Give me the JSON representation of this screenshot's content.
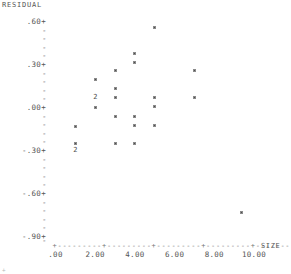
{
  "chart_data": {
    "type": "scatter",
    "title": "",
    "ylabel": "RESIDUAL",
    "xlabel": "SIZE",
    "xlim": [
      0,
      10.5
    ],
    "ylim": [
      -0.9,
      0.6
    ],
    "grid": false,
    "legend": "none",
    "y_tick_labels": [
      ".60+",
      ".30+",
      ".00+",
      "-.30+",
      "-.60+",
      "-.90+"
    ],
    "y_tick_values": [
      0.6,
      0.3,
      0.0,
      -0.3,
      -0.6,
      -0.9
    ],
    "y_minor_tick_count_between": 4,
    "x_tick_labels": [
      ".00",
      "2.00",
      "4.00",
      "6.00",
      "8.00",
      "10.00"
    ],
    "x_tick_values": [
      0,
      2,
      4,
      6,
      8,
      10
    ],
    "point_marker": "small-filled-square",
    "overlap_marker_label": "2",
    "points": [
      {
        "x": 5.0,
        "y": 0.56,
        "count": 1
      },
      {
        "x": 4.0,
        "y": 0.38,
        "count": 1
      },
      {
        "x": 4.0,
        "y": 0.32,
        "count": 1
      },
      {
        "x": 3.0,
        "y": 0.265,
        "count": 1
      },
      {
        "x": 7.0,
        "y": 0.265,
        "count": 1
      },
      {
        "x": 2.0,
        "y": 0.2,
        "count": 1
      },
      {
        "x": 3.0,
        "y": 0.135,
        "count": 1
      },
      {
        "x": 3.0,
        "y": 0.075,
        "count": 1
      },
      {
        "x": 5.0,
        "y": 0.075,
        "count": 1
      },
      {
        "x": 7.0,
        "y": 0.075,
        "count": 1
      },
      {
        "x": 2.0,
        "y": 0.07,
        "count": 2
      },
      {
        "x": 2.0,
        "y": 0.005,
        "count": 1
      },
      {
        "x": 5.0,
        "y": 0.01,
        "count": 1
      },
      {
        "x": 3.0,
        "y": -0.06,
        "count": 1
      },
      {
        "x": 4.0,
        "y": -0.06,
        "count": 1
      },
      {
        "x": 1.0,
        "y": -0.13,
        "count": 1
      },
      {
        "x": 4.0,
        "y": -0.125,
        "count": 1
      },
      {
        "x": 5.0,
        "y": -0.125,
        "count": 1
      },
      {
        "x": 1.0,
        "y": -0.245,
        "count": 1
      },
      {
        "x": 3.0,
        "y": -0.245,
        "count": 1
      },
      {
        "x": 4.0,
        "y": -0.245,
        "count": 1
      },
      {
        "x": 1.0,
        "y": -0.3,
        "count": 2
      },
      {
        "x": 9.35,
        "y": -0.73,
        "count": 1
      }
    ]
  },
  "axis": {
    "y_title": "RESIDUAL",
    "x_title": "SIZE",
    "x_axis_glyphs": "+---------+---------+---------+---------+---------+"
  },
  "footer": {
    "corner_mark": "+"
  }
}
